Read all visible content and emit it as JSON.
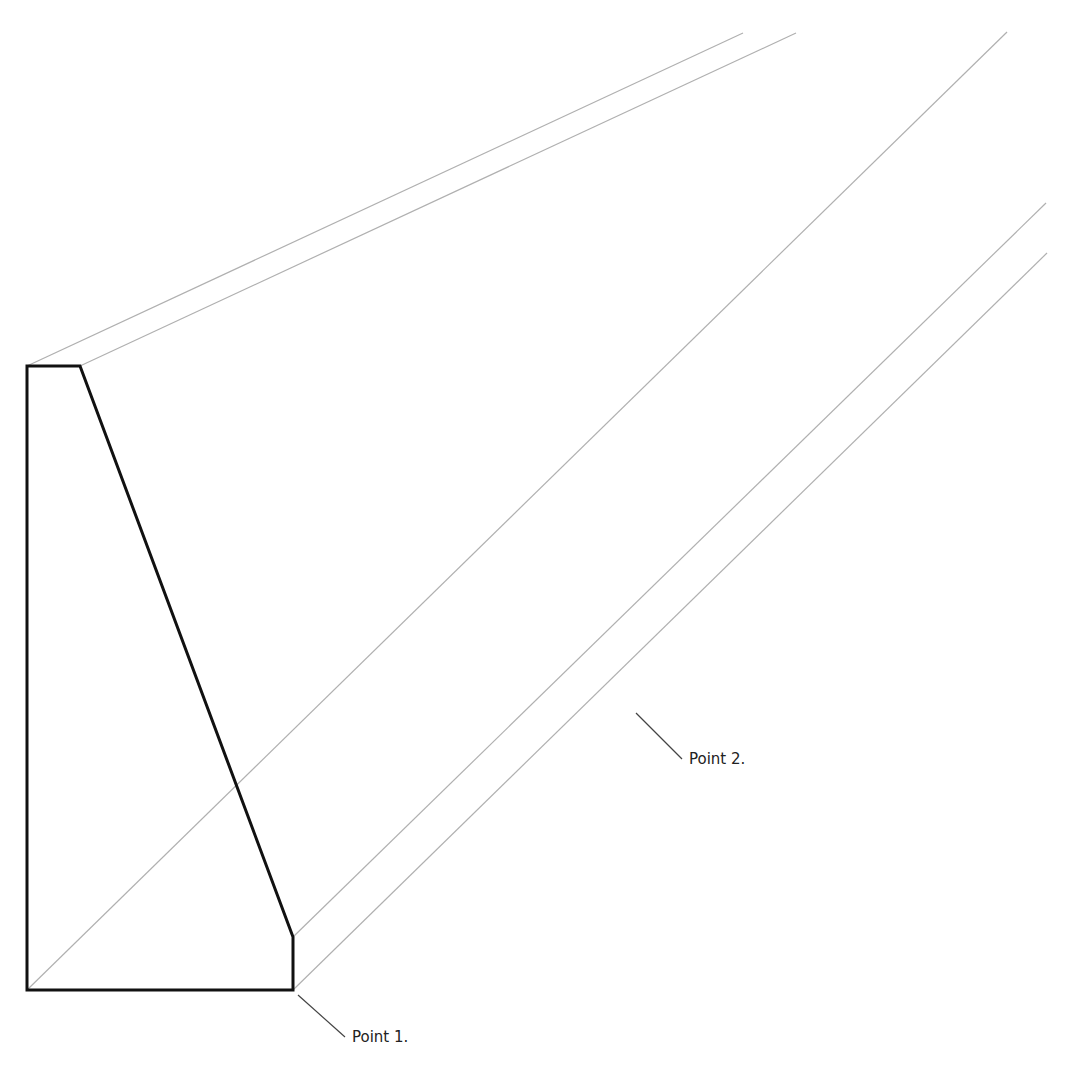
{
  "diagram": {
    "type": "isometric-profile-extrusion",
    "colors": {
      "profile_outline": "#111111",
      "extrusion_lines": "#b0b0b0",
      "leader_lines": "#444444",
      "label_text": "#222222",
      "background": "#ffffff"
    },
    "profile": {
      "points": [
        [
          27,
          366
        ],
        [
          80,
          366
        ],
        [
          293,
          937
        ],
        [
          293,
          990
        ],
        [
          27,
          990
        ]
      ],
      "diagonal_edge": [
        [
          80,
          366
        ],
        [
          293,
          937
        ]
      ]
    },
    "extrusion_lines": [
      {
        "from": [
          27,
          366
        ],
        "to": [
          743,
          33
        ]
      },
      {
        "from": [
          80,
          366
        ],
        "to": [
          796,
          33
        ]
      },
      {
        "from": [
          27,
          990
        ],
        "to": [
          1007,
          32
        ]
      },
      {
        "from": [
          293,
          937
        ],
        "to": [
          1046,
          203
        ]
      },
      {
        "from": [
          293,
          990
        ],
        "to": [
          1047,
          253
        ]
      }
    ],
    "annotations": [
      {
        "id": "point1",
        "label": "Point 1.",
        "leader_from": [
          298,
          995
        ],
        "leader_to": [
          345,
          1037
        ],
        "label_pos": [
          352,
          1028
        ]
      },
      {
        "id": "point2",
        "label": "Point 2.",
        "leader_from": [
          636,
          713
        ],
        "leader_to": [
          682,
          759
        ],
        "label_pos": [
          689,
          750
        ]
      }
    ]
  }
}
